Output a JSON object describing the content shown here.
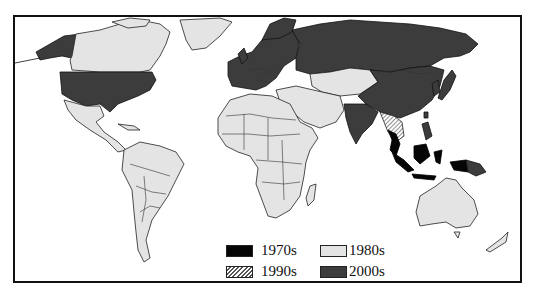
{
  "map": {
    "type": "choropleth world map",
    "categories": {
      "c1970s": {
        "label": "1970s",
        "color": "#050505",
        "pattern": "solid"
      },
      "c1980s": {
        "label": "1980s",
        "color": "#e4e4e4",
        "pattern": "solid"
      },
      "c1990s": {
        "label": "1990s",
        "color": "#ffffff",
        "pattern": "diagonal-hatch"
      },
      "c2000s": {
        "label": "2000s",
        "color": "#3c3c3c",
        "pattern": "solid"
      }
    },
    "regions": {
      "2000s": [
        "United States",
        "Alaska",
        "Western Europe",
        "Russia",
        "China",
        "Mongolia",
        "India",
        "Japan",
        "Korea",
        "Philippines",
        "Papua New Guinea"
      ],
      "1980s": [
        "Canada",
        "Greenland",
        "Mexico",
        "Central America",
        "South America",
        "Africa",
        "Middle East",
        "Central Asia",
        "Australia",
        "New Zealand"
      ],
      "1970s": [
        "Thailand",
        "Malaysia",
        "Indonesia"
      ],
      "1990s": [
        "Myanmar",
        "Cambodia",
        "Vietnam"
      ]
    }
  },
  "legend": {
    "items": [
      {
        "label": "1970s"
      },
      {
        "label": "1980s"
      },
      {
        "label": "1990s"
      },
      {
        "label": "2000s"
      }
    ]
  }
}
